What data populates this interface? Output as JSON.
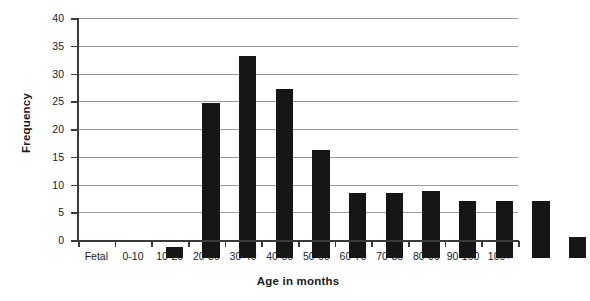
{
  "chart_data": {
    "type": "bar",
    "title": "",
    "xlabel": "Age in months",
    "ylabel": "Frequency",
    "categories": [
      "Fetal",
      "0-10",
      "10-20",
      "20-30",
      "30-40",
      "40-50",
      "50-60",
      "60-70",
      "70-80",
      "80-90",
      "90-100",
      "100+"
    ],
    "values": [
      2.0,
      28.0,
      36.4,
      30.5,
      19.4,
      11.8,
      11.8,
      12.0,
      10.3,
      10.3,
      10.3,
      3.7
    ],
    "ylim": [
      0,
      40
    ],
    "yticks": [
      0,
      5,
      10,
      15,
      20,
      25,
      30,
      35,
      40
    ],
    "ytick_labels": [
      "0",
      "5",
      "10",
      "15",
      "20",
      "25",
      "30",
      "35",
      "40"
    ],
    "grid": true,
    "grid_axis": "y",
    "legend": false,
    "bar_color": "#161616",
    "grid_color": "#9a9a9a",
    "axis_color": "#3a3a3a",
    "background": "#ffffff"
  }
}
